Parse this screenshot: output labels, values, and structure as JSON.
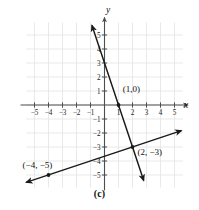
{
  "figure": {
    "caption": "(c)",
    "x_axis_name": "x",
    "y_axis_name": "y"
  },
  "chart_data": {
    "type": "line",
    "title": "",
    "xlabel": "x",
    "ylabel": "y",
    "xlim": [
      -6,
      6
    ],
    "ylim": [
      -6,
      6
    ],
    "grid": true,
    "grid_color": "#e3e3e3",
    "axis_color": "#4d4d4d",
    "line_color": "#1a1a1a",
    "legend": "none",
    "xticks": [
      -5,
      -4,
      -3,
      -2,
      -1,
      1,
      2,
      3,
      4,
      5
    ],
    "yticks": [
      -5,
      -4,
      -3,
      -2,
      -1,
      1,
      2,
      3,
      4,
      5
    ],
    "xtick_labels": [
      "-5",
      "-4",
      "-3",
      "-2",
      "-1",
      "1",
      "2",
      "3",
      "4",
      "5"
    ],
    "ytick_labels": [
      "-5",
      "-4",
      "-3",
      "-2",
      "-1",
      "1",
      "2",
      "3",
      "4",
      "5"
    ],
    "series": [
      {
        "name": "steep-line",
        "equation": "y = -3x + 3",
        "slope": -3,
        "intercept": 3,
        "x": [
          -0.9,
          2.8
        ],
        "y": [
          5.7,
          -5.4
        ],
        "arrows": "both"
      },
      {
        "name": "shallow-line",
        "equation": "y = (1/3)x - 11/3",
        "slope": 0.3333,
        "intercept": -3.6667,
        "x": [
          -5.6,
          5.5
        ],
        "y": [
          -5.53,
          -1.83
        ],
        "arrows": "both"
      }
    ],
    "points": [
      {
        "label": "(1,0)",
        "x": 1,
        "y": 0,
        "label_x": 1.3,
        "label_y": 0.95
      },
      {
        "label": "(2, −3)",
        "x": 2,
        "y": -3,
        "label_x": 2.35,
        "label_y": -3.6
      },
      {
        "label": "(−4, −5)",
        "x": -4,
        "y": -5,
        "label_x": -5.85,
        "label_y": -4.5
      }
    ],
    "annotations": [
      "(1,0)",
      "(2, −3)",
      "(−4, −5)"
    ]
  }
}
